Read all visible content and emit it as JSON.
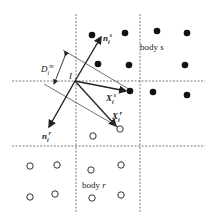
{
  "diagram": {
    "labels": {
      "body_s": {
        "word": "body",
        "var": "s"
      },
      "body_r": {
        "word": "body",
        "var": "r"
      },
      "point_I": "I",
      "normal_s": {
        "base": "n",
        "sub": "i",
        "sup": "s"
      },
      "normal_r": {
        "base": "n",
        "sub": "i",
        "sup": "r"
      },
      "X_s": {
        "base": "X",
        "sub": "i",
        "sup": "s"
      },
      "X_r": {
        "base": "X",
        "sub": "i",
        "sup": "r"
      },
      "D": {
        "base": "D",
        "sub": "i",
        "sup": "m"
      }
    },
    "colors": {
      "line": "#222222",
      "dash": "#555555",
      "filled_dot": "#111111"
    },
    "filled_dots": [
      [
        92,
        35
      ],
      [
        125,
        33
      ],
      [
        157,
        31
      ],
      [
        187,
        33
      ],
      [
        98,
        64
      ],
      [
        129,
        65
      ],
      [
        185,
        65
      ],
      [
        130,
        91
      ],
      [
        153,
        92
      ],
      [
        187,
        95
      ]
    ],
    "open_dots": [
      [
        93,
        136
      ],
      [
        120,
        129
      ],
      [
        30,
        166
      ],
      [
        57,
        165
      ],
      [
        91,
        170
      ],
      [
        121,
        165
      ],
      [
        30,
        197
      ],
      [
        55,
        194
      ],
      [
        92,
        198
      ],
      [
        121,
        195
      ]
    ]
  }
}
